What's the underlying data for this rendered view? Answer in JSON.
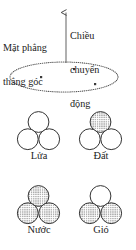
{
  "figure": {
    "language": "Vietnamese",
    "colors": {
      "ink": "#232323",
      "stroke": "#3a3a3a",
      "fill_dot": "#6b6b6b",
      "background": "#ffffff"
    }
  },
  "plane": {
    "label": "Mặt phẳng\nthẳng góc",
    "label_line1": "Mặt phẳng",
    "label_line2": "thẳng góc",
    "shape": "dotted-ellipse",
    "ellipse": {
      "cx": 64,
      "cy": 77,
      "rx": 54,
      "ry": 15
    },
    "points": [
      {
        "name": "point-left",
        "x": 41,
        "y": 77
      },
      {
        "name": "point-top",
        "x": 74,
        "y": 69
      },
      {
        "name": "point-right",
        "x": 95,
        "y": 84
      }
    ]
  },
  "motion": {
    "label": "Chiều\nchuyển\nđộng",
    "label_line1": "Chiều",
    "label_line2": "chuyển",
    "label_line3": "động",
    "arrow": {
      "x": 66,
      "y_tip": 10,
      "y_tail": 63,
      "direction": "up"
    }
  },
  "elements": [
    {
      "id": "fire",
      "label": "Lửa",
      "meaning": "Fire",
      "circles": [
        {
          "position": "top",
          "filled": false
        },
        {
          "position": "bottom-left",
          "filled": false
        },
        {
          "position": "bottom-right",
          "filled": false
        }
      ]
    },
    {
      "id": "earth",
      "label": "Đất",
      "meaning": "Earth",
      "circles": [
        {
          "position": "top",
          "filled": true
        },
        {
          "position": "bottom-left",
          "filled": false
        },
        {
          "position": "bottom-right",
          "filled": false
        }
      ]
    },
    {
      "id": "water",
      "label": "Nước",
      "meaning": "Water",
      "circles": [
        {
          "position": "top",
          "filled": true
        },
        {
          "position": "bottom-left",
          "filled": true
        },
        {
          "position": "bottom-right",
          "filled": true
        }
      ]
    },
    {
      "id": "wind",
      "label": "Gió",
      "meaning": "Wind",
      "circles": [
        {
          "position": "top",
          "filled": false
        },
        {
          "position": "bottom-left",
          "filled": true
        },
        {
          "position": "bottom-right",
          "filled": true
        }
      ]
    }
  ]
}
